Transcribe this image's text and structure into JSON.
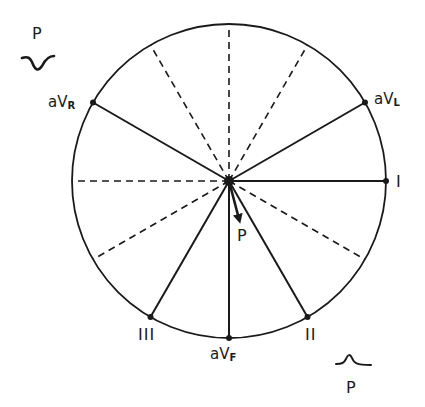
{
  "diagram": {
    "type": "hexaxial-reference-system",
    "center": {
      "x": 229,
      "y": 181
    },
    "radius": 157,
    "leads": [
      {
        "name": "I",
        "angle_deg": 0,
        "line": "solid"
      },
      {
        "name": "aVL",
        "prefix": "aV",
        "sub": "L",
        "angle_deg": -30,
        "line": "solid"
      },
      {
        "name": "aVR",
        "prefix": "aV",
        "sub": "R",
        "angle_deg": -150,
        "line": "solid"
      },
      {
        "name": "II",
        "angle_deg": 60,
        "line": "solid"
      },
      {
        "name": "aVF",
        "prefix": "aV",
        "sub": "F",
        "angle_deg": 90,
        "line": "solid"
      },
      {
        "name": "III",
        "angle_deg": 120,
        "line": "solid"
      }
    ],
    "dashed_axes_deg": [
      30,
      150,
      180,
      -60,
      -90,
      -120
    ],
    "vector": {
      "label": "P",
      "angle_deg": 75,
      "length_px": 42
    },
    "waveforms": [
      {
        "label": "P",
        "shape": "inverted",
        "position": "top-left"
      },
      {
        "label": "P",
        "shape": "upright",
        "position": "bottom-right"
      }
    ]
  },
  "labels": {
    "top_left_p": "P",
    "avr_prefix": "aV",
    "avr_sub": "R",
    "avl_prefix": "aV",
    "avl_sub": "L",
    "lead_i": "I",
    "lead_ii": "II",
    "lead_iii": "III",
    "avf_prefix": "aV",
    "avf_sub": "F",
    "vector_p": "P",
    "bottom_right_p": "P"
  },
  "colors": {
    "line": "#1a1a1a",
    "background": "#ffffff"
  }
}
